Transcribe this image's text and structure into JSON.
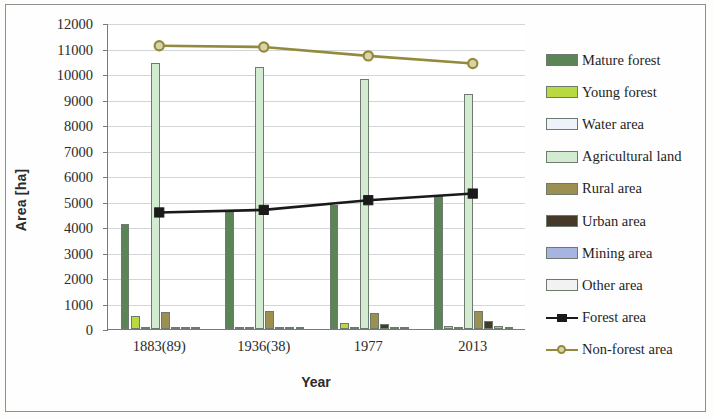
{
  "figure": {
    "background": "#fdfdfc",
    "border_color": "#8f8f8f"
  },
  "axes": {
    "y_title": "Area [ha]",
    "x_title": "Year"
  },
  "chart_data": {
    "type": "bar",
    "title": "",
    "subtitle": "",
    "xlabel": "Year",
    "ylabel": "Area [ha]",
    "categories": [
      "1883(89)",
      "1936(38)",
      "1977",
      "2013"
    ],
    "ylim": [
      0,
      12000
    ],
    "ytick_step": 1000,
    "yticks": [
      0,
      1000,
      2000,
      3000,
      4000,
      5000,
      6000,
      7000,
      8000,
      9000,
      10000,
      11000,
      12000
    ],
    "ytick_labels": [
      "0",
      "1000",
      "2000",
      "3000",
      "4000",
      "5000",
      "6000",
      "7000",
      "8000",
      "9000",
      "10000",
      "11000",
      "12000"
    ],
    "grid": true,
    "grid_axis": "y",
    "legend_position": "right",
    "series": [
      {
        "name": "Mature forest",
        "kind": "bar",
        "color": "#5b8457",
        "values": [
          4100,
          4650,
          4850,
          5200
        ]
      },
      {
        "name": "Young forest",
        "kind": "bar",
        "color": "#b8d93f",
        "values": [
          510,
          60,
          240,
          110
        ]
      },
      {
        "name": "Water area",
        "kind": "bar",
        "color": "#eef2fb",
        "values": [
          40,
          45,
          50,
          55
        ]
      },
      {
        "name": "Agricultural land",
        "kind": "bar",
        "color": "#d3ecd1",
        "values": [
          10450,
          10280,
          9800,
          9200
        ]
      },
      {
        "name": "Rural area",
        "kind": "bar",
        "color": "#9b8f51",
        "values": [
          680,
          720,
          620,
          700
        ]
      },
      {
        "name": "Urban area",
        "kind": "bar",
        "color": "#46392a",
        "values": [
          30,
          90,
          180,
          330
        ]
      },
      {
        "name": "Mining area",
        "kind": "bar",
        "color": "#a7b3e0",
        "values": [
          0,
          20,
          30,
          120
        ]
      },
      {
        "name": "Other area",
        "kind": "bar",
        "color": "#f2f2f2",
        "values": [
          20,
          25,
          35,
          60
        ]
      },
      {
        "name": "Forest area",
        "kind": "line",
        "color": "#1a1a1a",
        "marker": "square",
        "values": [
          4610,
          4710,
          5090,
          5350
        ]
      },
      {
        "name": "Non-forest area",
        "kind": "line",
        "color": "#938a3d",
        "marker": "circle",
        "values": [
          11150,
          11100,
          10750,
          10450
        ]
      }
    ]
  },
  "legend": {
    "items": [
      {
        "label": "Mature forest",
        "type": "bar",
        "color": "#5b8457"
      },
      {
        "label": "Young forest",
        "type": "bar",
        "color": "#b8d93f"
      },
      {
        "label": "Water area",
        "type": "bar",
        "color": "#eef2fb"
      },
      {
        "label": "Agricultural land",
        "type": "bar",
        "color": "#d3ecd1"
      },
      {
        "label": "Rural area",
        "type": "bar",
        "color": "#9b8f51"
      },
      {
        "label": "Urban area",
        "type": "bar",
        "color": "#46392a"
      },
      {
        "label": "Mining area",
        "type": "bar",
        "color": "#a7b3e0"
      },
      {
        "label": "Other area",
        "type": "bar",
        "color": "#f2f2f2"
      },
      {
        "label": "Forest area",
        "type": "line",
        "color": "#1a1a1a",
        "marker": "square"
      },
      {
        "label": "Non-forest area",
        "type": "line",
        "color": "#938a3d",
        "marker": "circle"
      }
    ]
  }
}
